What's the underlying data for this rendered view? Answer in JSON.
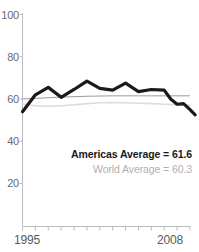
{
  "chart_data": {
    "type": "line",
    "title": "",
    "subtitle": "",
    "xlabel": "",
    "ylabel": "",
    "xlim": [
      1995,
      2008
    ],
    "ylim": [
      0,
      100
    ],
    "grid": false,
    "legend_position": "inside-bottom-right",
    "y_ticks": [
      100,
      80,
      60,
      40,
      20
    ],
    "y_tick_labels": [
      "100",
      "80",
      "60",
      "40",
      "20"
    ],
    "x_ticks": [
      1995,
      1996,
      1997,
      1998,
      1999,
      2000,
      2001,
      2002,
      2003,
      2004,
      2005,
      2006,
      2007,
      2008
    ],
    "x_tick_labels_shown": [
      "1995",
      "2008"
    ],
    "x": [
      1995,
      1996,
      1997,
      1998,
      1999,
      2000,
      2001,
      2002,
      2003,
      2004,
      2005,
      2006,
      2007,
      2008
    ],
    "series": [
      {
        "name": "Americas Average",
        "color": "#1a1a1a",
        "width": 3.2,
        "values": [
          54.0,
          62.0,
          65.5,
          60.8,
          64.5,
          68.5,
          65.0,
          64.2,
          67.5,
          63.5,
          64.5,
          64.2,
          57.5,
          57.8
        ]
      },
      {
        "name": "World Average",
        "color": "#9a9a9a",
        "width": 1.0,
        "values": [
          60.0,
          60.3,
          60.6,
          60.9,
          61.1,
          61.3,
          61.4,
          61.5,
          61.5,
          61.5,
          61.5,
          61.5,
          61.5,
          61.5
        ]
      },
      {
        "name": "World Average Light",
        "color": "#dcdcdc",
        "width": 1.6,
        "values": [
          57.5,
          56.8,
          56.6,
          56.8,
          57.2,
          57.8,
          58.2,
          58.3,
          58.2,
          58.0,
          57.8,
          57.5,
          57.2,
          57.0
        ]
      }
    ],
    "dark_line_tail": {
      "note": "Americas series continues declining after 2006",
      "points": [
        [
          2006,
          64.2
        ],
        [
          2006.5,
          60.0
        ],
        [
          2007,
          57.5
        ],
        [
          2007.5,
          57.8
        ],
        [
          2008,
          55.0
        ],
        [
          2008.4,
          52.5
        ]
      ]
    },
    "annotations": [
      {
        "name": "americas-average",
        "text": "Americas Average = 61.6",
        "value": 61.6,
        "color": "#1a1a1a"
      },
      {
        "name": "world-average",
        "text": "World Average = 60.3",
        "value": 60.3,
        "color": "#b0b0b0"
      }
    ]
  },
  "axes": {
    "y_labels": [
      "100",
      "80",
      "60",
      "40",
      "20"
    ],
    "x_start_label": "1995",
    "x_end_label": "2008",
    "axis_color": "#bdbdbd"
  },
  "legend": {
    "americas_text": "Americas Average = 61.6",
    "world_text": "World Average = 60.3"
  }
}
